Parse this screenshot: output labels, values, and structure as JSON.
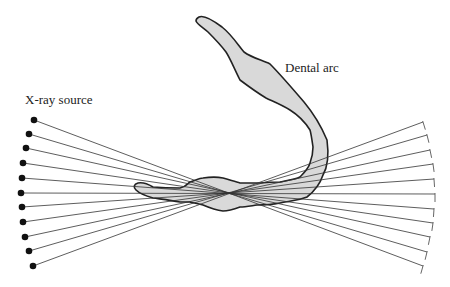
{
  "diagram": {
    "labels": {
      "source": "X-ray source",
      "arc": "Dental arc"
    },
    "colors": {
      "ray": "#333333",
      "arc_fill": "#d9d9d9",
      "arc_stroke": "#222222",
      "source_dot": "#111111",
      "detector": "#555555"
    },
    "focal_point": [
      230,
      193
    ],
    "sources": [
      [
        34,
        120
      ],
      [
        29,
        134
      ],
      [
        26,
        148
      ],
      [
        23,
        163
      ],
      [
        22,
        178
      ],
      [
        21,
        193
      ],
      [
        22,
        207
      ],
      [
        23,
        222
      ],
      [
        25,
        237
      ],
      [
        29,
        251
      ],
      [
        33,
        266
      ]
    ],
    "detectors": [
      [
        423,
        122
      ],
      [
        427,
        135
      ],
      [
        430,
        150
      ],
      [
        433,
        164
      ],
      [
        434,
        179
      ],
      [
        435,
        194
      ],
      [
        434,
        209
      ],
      [
        433,
        223
      ],
      [
        430,
        237
      ],
      [
        427,
        252
      ],
      [
        423,
        266
      ]
    ]
  }
}
